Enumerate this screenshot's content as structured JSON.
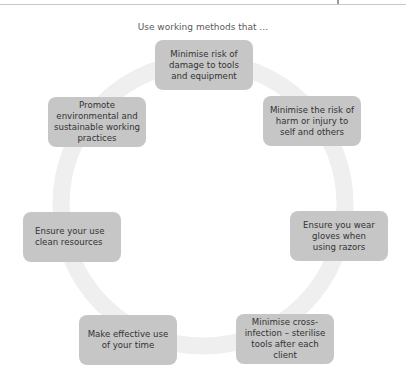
{
  "header": {
    "rule": true
  },
  "diagram": {
    "title": "Use working methods that …",
    "colors": {
      "box_fill": "#c6c6c6",
      "ring": "#efefef",
      "text": "#333333"
    },
    "nodes": [
      {
        "id": "top",
        "label": "Minimise risk of damage to tools and equipment"
      },
      {
        "id": "upper-right",
        "label": "Minimise the risk of harm or injury to self and others"
      },
      {
        "id": "lower-right",
        "label": "Ensure you wear gloves when using razors"
      },
      {
        "id": "bottom-right",
        "label": "Minimise cross-infection – sterilise tools after each client"
      },
      {
        "id": "bottom-left",
        "label": "Make effective use of your time"
      },
      {
        "id": "lower-left",
        "label": "Ensure your use clean resources"
      },
      {
        "id": "upper-left",
        "label": "Promote environmental and sustainable working practices"
      }
    ]
  }
}
